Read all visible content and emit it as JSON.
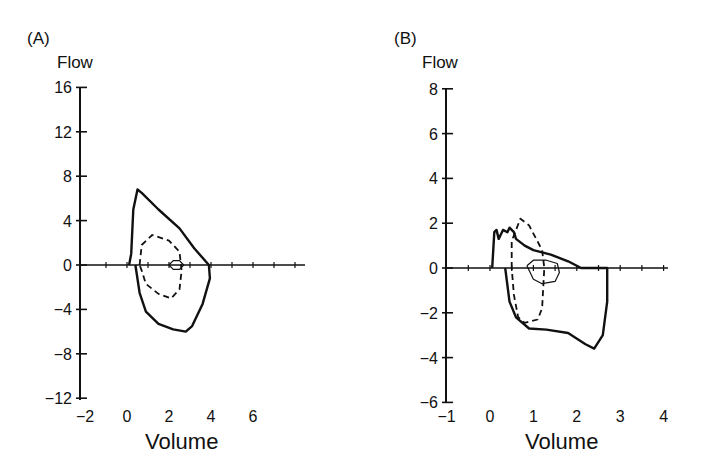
{
  "chart_data": [
    {
      "panel": "(A)",
      "type": "line",
      "title": "",
      "ylabel": "Flow",
      "xlabel": "Volume",
      "ylim": [
        -12,
        16
      ],
      "xlim": [
        -2,
        8
      ],
      "yticks": [
        16,
        12,
        8,
        4,
        0,
        -4,
        -8,
        -12
      ],
      "ytick_labels": [
        "16",
        "12",
        "8",
        "4",
        "0",
        "−4",
        "−8",
        "−12"
      ],
      "xticks": [
        -2,
        0,
        2,
        4,
        6
      ],
      "xtick_labels": [
        "−2",
        "0",
        "2",
        "4",
        "6"
      ],
      "grid": false,
      "legend": null,
      "series": [
        {
          "name": "outer loop (solid)",
          "style": "solid-thick",
          "points": [
            [
              0.1,
              0
            ],
            [
              0.2,
              1
            ],
            [
              0.3,
              5
            ],
            [
              0.5,
              6.8
            ],
            [
              0.7,
              6.5
            ],
            [
              1.5,
              5
            ],
            [
              2.5,
              3.3
            ],
            [
              3.2,
              1.5
            ],
            [
              3.9,
              0
            ],
            [
              3.95,
              -1.2
            ],
            [
              3.6,
              -3.5
            ],
            [
              3.1,
              -5.5
            ],
            [
              2.8,
              -6
            ],
            [
              2.2,
              -5.8
            ],
            [
              1.5,
              -5.3
            ],
            [
              0.9,
              -4.2
            ],
            [
              0.6,
              -2.5
            ],
            [
              0.4,
              0
            ]
          ]
        },
        {
          "name": "middle loop (dashed)",
          "style": "dashed",
          "points": [
            [
              0.6,
              0
            ],
            [
              0.7,
              1.8
            ],
            [
              1.2,
              2.7
            ],
            [
              2.0,
              2.2
            ],
            [
              2.5,
              1.2
            ],
            [
              2.6,
              -0.5
            ],
            [
              2.5,
              -2.2
            ],
            [
              2.1,
              -3
            ],
            [
              1.5,
              -2.6
            ],
            [
              0.9,
              -1.7
            ],
            [
              0.7,
              -0.5
            ],
            [
              0.6,
              0
            ]
          ]
        },
        {
          "name": "inner loop (thin)",
          "style": "solid-thin",
          "points": [
            [
              2.0,
              0
            ],
            [
              2.2,
              0.4
            ],
            [
              2.5,
              0.4
            ],
            [
              2.7,
              0
            ],
            [
              2.5,
              -0.4
            ],
            [
              2.2,
              -0.4
            ],
            [
              2.0,
              0
            ]
          ]
        }
      ]
    },
    {
      "panel": "(B)",
      "type": "line",
      "title": "",
      "ylabel": "Flow",
      "xlabel": "Volume",
      "ylim": [
        -6,
        8
      ],
      "xlim": [
        -1,
        4
      ],
      "yticks": [
        8,
        6,
        4,
        2,
        0,
        -2,
        -4,
        -6
      ],
      "ytick_labels": [
        "8",
        "6",
        "4",
        "2",
        "0",
        "−2",
        "−4",
        "−6"
      ],
      "xticks": [
        -1,
        0,
        1,
        2,
        3,
        4
      ],
      "xtick_labels": [
        "−1",
        "0",
        "1",
        "2",
        "3",
        "4"
      ],
      "grid": false,
      "legend": null,
      "series": [
        {
          "name": "outer loop (solid)",
          "style": "solid-thick",
          "points": [
            [
              0.05,
              0
            ],
            [
              0.1,
              1.6
            ],
            [
              0.15,
              1.7
            ],
            [
              0.2,
              1.3
            ],
            [
              0.3,
              1.7
            ],
            [
              0.4,
              1.6
            ],
            [
              0.45,
              1.8
            ],
            [
              0.55,
              1.6
            ],
            [
              0.6,
              1.3
            ],
            [
              0.8,
              1.0
            ],
            [
              1.0,
              0.8
            ],
            [
              1.4,
              0.6
            ],
            [
              1.8,
              0.3
            ],
            [
              2.1,
              0
            ],
            [
              2.7,
              0
            ],
            [
              2.7,
              -1.5
            ],
            [
              2.6,
              -3
            ],
            [
              2.4,
              -3.6
            ],
            [
              2.2,
              -3.4
            ],
            [
              1.8,
              -2.9
            ],
            [
              1.3,
              -2.75
            ],
            [
              0.9,
              -2.7
            ],
            [
              0.6,
              -2.2
            ],
            [
              0.45,
              -1.5
            ],
            [
              0.35,
              0
            ]
          ]
        },
        {
          "name": "middle loop (dashed)",
          "style": "dashed",
          "points": [
            [
              0.5,
              0
            ],
            [
              0.5,
              1.2
            ],
            [
              0.7,
              2.2
            ],
            [
              0.9,
              1.9
            ],
            [
              1.2,
              0.8
            ],
            [
              1.25,
              0
            ],
            [
              1.2,
              -1.8
            ],
            [
              1.1,
              -2.3
            ],
            [
              0.8,
              -2.45
            ],
            [
              0.65,
              -2.2
            ],
            [
              0.55,
              -1.2
            ],
            [
              0.5,
              0
            ]
          ]
        },
        {
          "name": "inner loop (thin)",
          "style": "solid-thin",
          "points": [
            [
              0.85,
              0.1
            ],
            [
              1.0,
              0.35
            ],
            [
              1.3,
              0.35
            ],
            [
              1.55,
              0.2
            ],
            [
              1.6,
              -0.2
            ],
            [
              1.5,
              -0.6
            ],
            [
              1.2,
              -0.7
            ],
            [
              1.0,
              -0.5
            ],
            [
              0.85,
              0.1
            ]
          ]
        }
      ]
    }
  ],
  "panels": {
    "a": {
      "label": "(A)",
      "ylabel": "Flow",
      "xlabel": "Volume"
    },
    "b": {
      "label": "(B)",
      "ylabel": "Flow",
      "xlabel": "Volume"
    }
  }
}
